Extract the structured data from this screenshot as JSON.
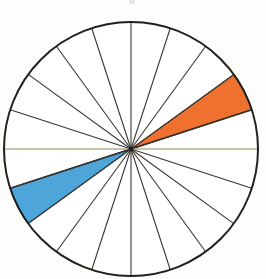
{
  "figure": {
    "title_remnant": "g",
    "background_color": "#fdfdfb"
  },
  "diagram": {
    "name": "rose-diagram",
    "center_x": 131,
    "center_y": 149,
    "radius": 127,
    "outline_color": "#231f1c",
    "outline_width": 2.0,
    "spoke_color": "#3a3630",
    "spoke_width": 1.1,
    "diameter_line_color": "#8d8a5c",
    "diameter_line_width": 1.2,
    "sector_count": 20,
    "sector_degrees": 18,
    "unfilled_color": "#ffffff"
  },
  "chart_data": {
    "type": "pie",
    "title": "",
    "subtitle": "",
    "xlabel": "",
    "ylabel": "",
    "grid": false,
    "legend_position": "none",
    "annotations": [],
    "axis_ranges": {
      "theta": [
        0,
        360
      ]
    },
    "categories": [
      "0-18",
      "18-36",
      "36-54",
      "54-72",
      "72-90",
      "90-108",
      "108-126",
      "126-144",
      "144-162",
      "162-180",
      "180-198",
      "198-216",
      "216-234",
      "234-252",
      "252-270",
      "270-288",
      "288-306",
      "306-324",
      "324-342",
      "342-360"
    ],
    "values": [
      1,
      1,
      1,
      1,
      1,
      1,
      1,
      1,
      1,
      1,
      1,
      1,
      1,
      1,
      1,
      1,
      1,
      1,
      1,
      1
    ],
    "series": [
      {
        "name": "sectors",
        "values": [
          1,
          1,
          1,
          1,
          1,
          1,
          1,
          1,
          1,
          1,
          1,
          1,
          1,
          1,
          1,
          1,
          1,
          1,
          1,
          1
        ]
      }
    ],
    "sectors": [
      {
        "index": 0,
        "start_deg": 0,
        "end_deg": 18,
        "fill": "#ffffff",
        "highlighted": false,
        "label": "sector-0"
      },
      {
        "index": 1,
        "start_deg": 18,
        "end_deg": 36,
        "fill": "#ef7130",
        "highlighted": true,
        "label": "sector-1-orange"
      },
      {
        "index": 2,
        "start_deg": 36,
        "end_deg": 54,
        "fill": "#ffffff",
        "highlighted": false,
        "label": "sector-2"
      },
      {
        "index": 3,
        "start_deg": 54,
        "end_deg": 72,
        "fill": "#ffffff",
        "highlighted": false,
        "label": "sector-3"
      },
      {
        "index": 4,
        "start_deg": 72,
        "end_deg": 90,
        "fill": "#ffffff",
        "highlighted": false,
        "label": "sector-4"
      },
      {
        "index": 5,
        "start_deg": 90,
        "end_deg": 108,
        "fill": "#ffffff",
        "highlighted": false,
        "label": "sector-5"
      },
      {
        "index": 6,
        "start_deg": 108,
        "end_deg": 126,
        "fill": "#ffffff",
        "highlighted": false,
        "label": "sector-6"
      },
      {
        "index": 7,
        "start_deg": 126,
        "end_deg": 144,
        "fill": "#ffffff",
        "highlighted": false,
        "label": "sector-7"
      },
      {
        "index": 8,
        "start_deg": 144,
        "end_deg": 162,
        "fill": "#ffffff",
        "highlighted": false,
        "label": "sector-8"
      },
      {
        "index": 9,
        "start_deg": 162,
        "end_deg": 180,
        "fill": "#ffffff",
        "highlighted": false,
        "label": "sector-9"
      },
      {
        "index": 10,
        "start_deg": 180,
        "end_deg": 198,
        "fill": "#ffffff",
        "highlighted": false,
        "label": "sector-10"
      },
      {
        "index": 11,
        "start_deg": 198,
        "end_deg": 216,
        "fill": "#4da5da",
        "highlighted": true,
        "label": "sector-11-blue"
      },
      {
        "index": 12,
        "start_deg": 216,
        "end_deg": 234,
        "fill": "#ffffff",
        "highlighted": false,
        "label": "sector-12"
      },
      {
        "index": 13,
        "start_deg": 234,
        "end_deg": 252,
        "fill": "#ffffff",
        "highlighted": false,
        "label": "sector-13"
      },
      {
        "index": 14,
        "start_deg": 252,
        "end_deg": 270,
        "fill": "#ffffff",
        "highlighted": false,
        "label": "sector-14"
      },
      {
        "index": 15,
        "start_deg": 270,
        "end_deg": 288,
        "fill": "#ffffff",
        "highlighted": false,
        "label": "sector-15"
      },
      {
        "index": 16,
        "start_deg": 288,
        "end_deg": 306,
        "fill": "#ffffff",
        "highlighted": false,
        "label": "sector-16"
      },
      {
        "index": 17,
        "start_deg": 306,
        "end_deg": 324,
        "fill": "#ffffff",
        "highlighted": false,
        "label": "sector-17"
      },
      {
        "index": 18,
        "start_deg": 324,
        "end_deg": 342,
        "fill": "#ffffff",
        "highlighted": false,
        "label": "sector-18"
      },
      {
        "index": 19,
        "start_deg": 342,
        "end_deg": 360,
        "fill": "#ffffff",
        "highlighted": false,
        "label": "sector-19"
      }
    ],
    "colors": {
      "highlight_orange": "#ef7130",
      "highlight_blue": "#4da5da",
      "outline": "#231f1c",
      "spoke": "#3a3630",
      "diameter": "#8d8a5c"
    }
  }
}
